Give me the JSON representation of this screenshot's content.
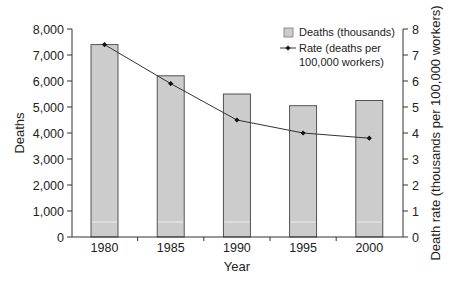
{
  "chart_data": {
    "type": "bar",
    "title": "",
    "xlabel": "Year",
    "ylabel": "Deaths",
    "y2label": "Death rate (thousands per 100,000 workers)",
    "categories": [
      "1980",
      "1985",
      "1990",
      "1995",
      "2000"
    ],
    "series": [
      {
        "name": "Deaths (thousands)",
        "type": "bar",
        "axis": "left",
        "values": [
          7400,
          6200,
          5500,
          5050,
          5250
        ],
        "color": "#cccccc"
      },
      {
        "name": "Rate (deaths per 100,000 workers)",
        "type": "line",
        "axis": "right",
        "values": [
          7.4,
          5.9,
          4.5,
          4.0,
          3.8
        ],
        "color": "#333333"
      }
    ],
    "ylim": [
      0,
      8000
    ],
    "y2lim": [
      0,
      8
    ],
    "yticks": [
      "0",
      "1,000",
      "2,000",
      "3,000",
      "4,000",
      "5,000",
      "6,000",
      "7,000",
      "8,000"
    ],
    "y2ticks": [
      "0",
      "1",
      "2",
      "3",
      "4",
      "5",
      "6",
      "7",
      "8"
    ],
    "grid": false,
    "legend_position": "upper right (inside)"
  },
  "legend": {
    "bar_label": "Deaths (thousands)",
    "line_label_1": "Rate (deaths per",
    "line_label_2": "100,000 workers)"
  },
  "axes": {
    "x_title": "Year",
    "y_title": "Deaths",
    "y2_title": "Death rate (thousands per 100,000 workers)"
  }
}
